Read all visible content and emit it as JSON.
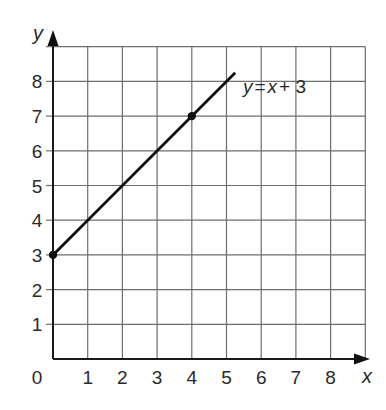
{
  "chart_data": {
    "type": "line",
    "title": "",
    "xlabel": "x",
    "ylabel": "y",
    "xlim": [
      0,
      9
    ],
    "ylim": [
      0,
      9
    ],
    "grid": true,
    "x_ticks": [
      "0",
      "1",
      "2",
      "3",
      "4",
      "5",
      "6",
      "7",
      "8"
    ],
    "y_ticks": [
      "1",
      "2",
      "3",
      "4",
      "5",
      "6",
      "7",
      "8"
    ],
    "series": [
      {
        "name": "y = x + 3",
        "equation": "y = x + 3",
        "x": [
          0,
          5.25
        ],
        "y": [
          3,
          8.25
        ]
      }
    ],
    "marked_points": [
      {
        "x": 0,
        "y": 3
      },
      {
        "x": 4,
        "y": 7
      }
    ],
    "annotations": [
      {
        "text": "y = x + 3",
        "x": 5.3,
        "y": 7.7
      }
    ],
    "legend": "none"
  },
  "labels": {
    "origin": "0",
    "x_axis": "x",
    "y_axis": "y",
    "equation_lhs": "y",
    "equation_eq": "=",
    "equation_x": "x",
    "equation_rest": "+ 3"
  }
}
